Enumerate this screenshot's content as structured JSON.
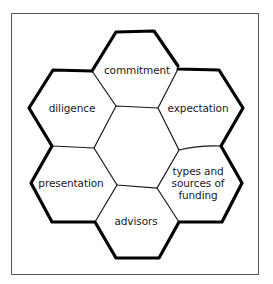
{
  "diagram": {
    "type": "honeycomb",
    "center_label": "",
    "cells": [
      {
        "id": "commitment",
        "label": "commitment",
        "position": "top"
      },
      {
        "id": "expectation",
        "label": "expectation",
        "position": "upper-right"
      },
      {
        "id": "types-and-sources-of-funding",
        "label": "types and sources of funding",
        "position": "lower-right"
      },
      {
        "id": "advisors",
        "label": "advisors",
        "position": "bottom"
      },
      {
        "id": "presentation",
        "label": "presentation",
        "position": "lower-left"
      },
      {
        "id": "diligence",
        "label": "diligence",
        "position": "upper-left"
      }
    ],
    "colors": {
      "outline": "#000000",
      "inner_lines": "#1a1a1a",
      "frame": "#555555",
      "background": "#ffffff"
    }
  }
}
